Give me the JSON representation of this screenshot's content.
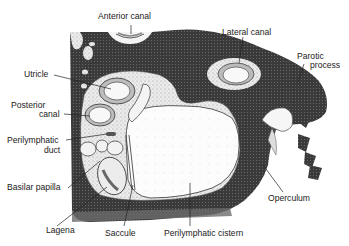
{
  "diagram": {
    "type": "anatomical-cross-section",
    "colors": {
      "bone_dark": "#3a3a3a",
      "stipple_light": "#e6e6e6",
      "cavity_white": "#fbfbfb",
      "line": "#222222"
    },
    "labels": {
      "anterior_canal": "Anterior canal",
      "lateral_canal": "Lateral canal",
      "parotic_process_1": "Parotic",
      "parotic_process_2": "process",
      "utricle": "Utricle",
      "posterior_canal_1": "Posterior",
      "posterior_canal_2": "canal",
      "perilymphatic_duct_1": "Perilymphatic",
      "perilymphatic_duct_2": "duct",
      "basilar_papilla": "Basilar papilla",
      "lagena": "Lagena",
      "saccule": "Saccule",
      "perilymphatic_cistern": "Perilymphatic cistern",
      "operculum": "Operculum"
    }
  }
}
